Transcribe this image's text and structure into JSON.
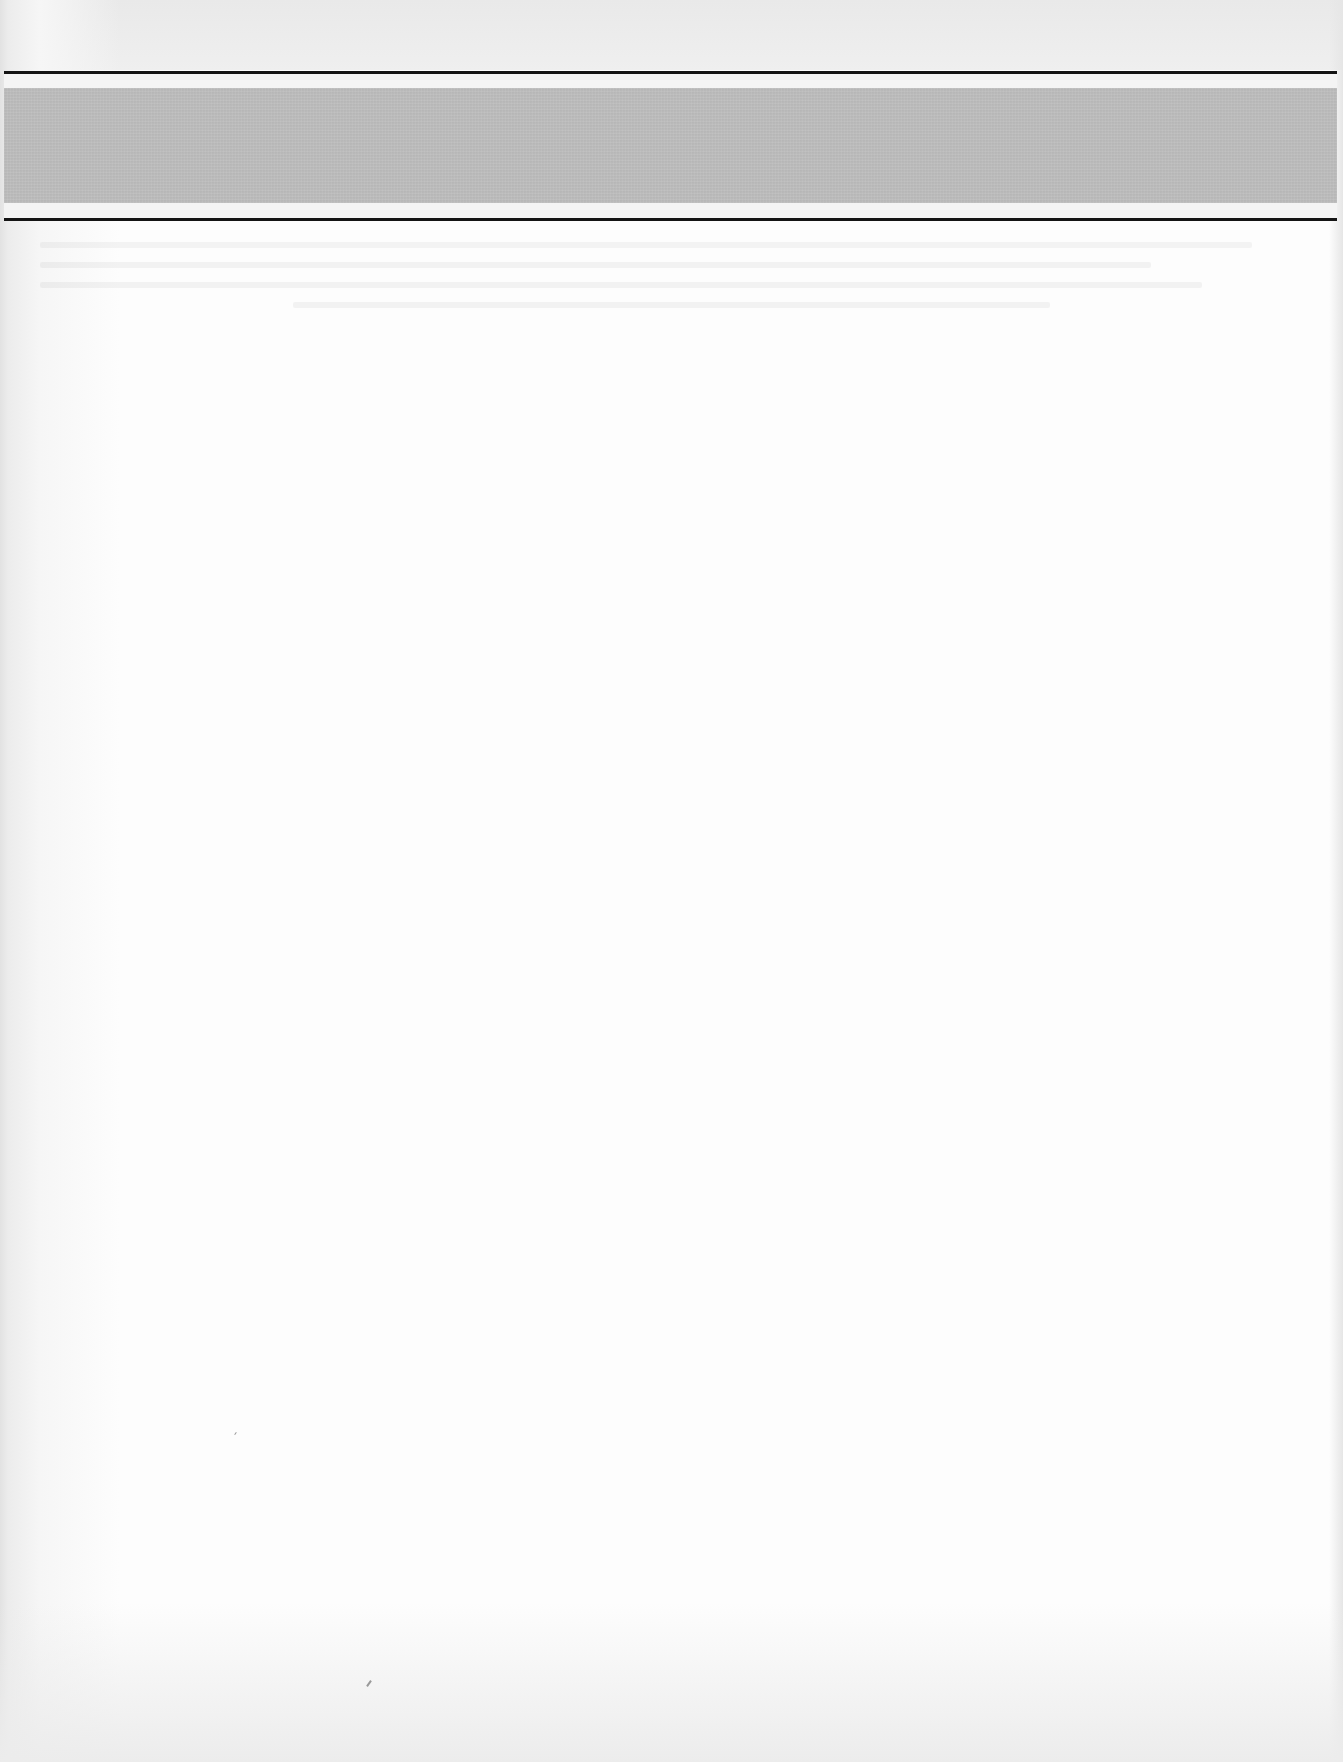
{
  "document": {
    "type": "scanned-page",
    "header_band": {
      "title": "",
      "fill_color": "#bdbdbd"
    },
    "rule_color": "#141414",
    "page_color": "#fdfdfd",
    "body_text": ""
  }
}
